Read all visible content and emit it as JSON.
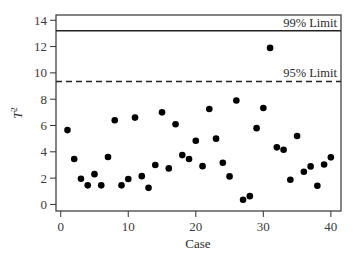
{
  "chart_data": {
    "type": "scatter",
    "title": "",
    "xlabel": "Case",
    "ylabel": "T",
    "ylabel_superscript": "2",
    "xlim": [
      -0.7,
      41.5
    ],
    "ylim": [
      -0.5,
      14.4
    ],
    "xticks": [
      0,
      10,
      20,
      30,
      40
    ],
    "yticks": [
      0,
      2,
      4,
      6,
      8,
      10,
      12,
      14
    ],
    "grid": false,
    "series": [
      {
        "name": "T2 statistic",
        "color": "#000000",
        "x": [
          1,
          2,
          3,
          4,
          5,
          6,
          7,
          8,
          9,
          10,
          11,
          12,
          13,
          14,
          15,
          16,
          17,
          18,
          19,
          20,
          21,
          22,
          23,
          24,
          25,
          26,
          27,
          28,
          29,
          30,
          31,
          32,
          33,
          34,
          35,
          36,
          37,
          38,
          39,
          40
        ],
        "y": [
          5.65,
          3.45,
          1.95,
          1.45,
          2.3,
          1.45,
          3.6,
          6.4,
          1.45,
          1.93,
          6.6,
          2.15,
          1.26,
          3.0,
          7.0,
          2.74,
          6.1,
          3.75,
          3.45,
          4.84,
          2.91,
          7.25,
          5.0,
          3.17,
          2.13,
          7.9,
          0.35,
          0.63,
          5.8,
          7.33,
          11.9,
          4.34,
          4.16,
          1.87,
          5.2,
          2.48,
          2.89,
          1.42,
          3.04,
          3.58
        ]
      }
    ],
    "reference_lines": [
      {
        "label": "99% Limit",
        "value": 13.2,
        "style": "solid"
      },
      {
        "label": "95% Limit",
        "value": 9.35,
        "style": "dashed"
      }
    ]
  }
}
